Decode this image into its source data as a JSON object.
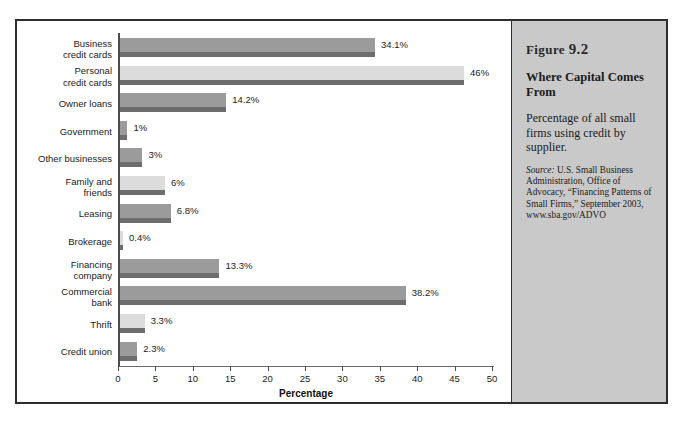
{
  "figure": {
    "number_label": "Figure",
    "number": "9.2",
    "title": "Where Capital Comes From",
    "description": "Percentage of all small firms using credit by supplier.",
    "source_lead": "Source:",
    "source_text": " U.S. Small Business Administration, Office of Advocacy, “Financing Patterns of Small Firms,” September 2003, www.sba.gov/ADVO"
  },
  "colors": {
    "bar_dark": "#9b9b9b",
    "bar_light": "#dcdcdc",
    "bar_shadow": "#6d6d6d",
    "panel_bg": "#c9c9c9",
    "frame": "#2e2e2e"
  },
  "chart_data": {
    "type": "bar",
    "orientation": "horizontal",
    "title": "Where Capital Comes From",
    "xlabel": "Percentage",
    "ylabel": "",
    "xlim": [
      0,
      50
    ],
    "xticks": [
      0,
      5,
      10,
      15,
      20,
      25,
      30,
      35,
      40,
      45,
      50
    ],
    "xtick_labels": [
      "0",
      "5",
      "10",
      "15",
      "20",
      "25",
      "30",
      "35",
      "40",
      "45",
      "50"
    ],
    "grid": false,
    "legend": "none",
    "categories": [
      "Business\ncredit cards",
      "Personal\ncredit cards",
      "Owner loans",
      "Government",
      "Other businesses",
      "Family and\nfriends",
      "Leasing",
      "Brokerage",
      "Financing\ncompany",
      "Commercial\nbank",
      "Thrift",
      "Credit union"
    ],
    "values": [
      34.1,
      46,
      14.2,
      1,
      3,
      6,
      6.8,
      0.4,
      13.3,
      38.2,
      3.3,
      2.3
    ],
    "value_labels": [
      "34.1%",
      "46%",
      "14.2%",
      "1%",
      "3%",
      "6%",
      "6.8%",
      "0.4%",
      "13.3%",
      "38.2%",
      "3.3%",
      "2.3%"
    ],
    "bar_shades": [
      "dark",
      "light",
      "dark",
      "dark",
      "dark",
      "light",
      "dark",
      "light",
      "dark",
      "dark",
      "light",
      "dark"
    ]
  }
}
